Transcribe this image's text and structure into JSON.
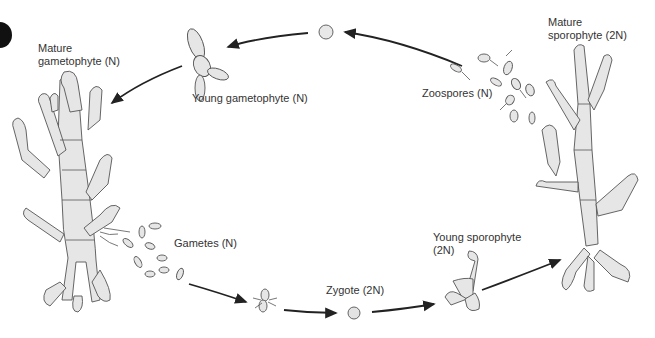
{
  "diagram": {
    "type": "life-cycle",
    "title": "",
    "stages": [
      {
        "id": "mature_gametophyte",
        "label": "Mature\ngametophyte (N)"
      },
      {
        "id": "young_gametophyte",
        "label": "Young gametophyte (N)"
      },
      {
        "id": "spore",
        "label": ""
      },
      {
        "id": "zoospores",
        "label": "Zoospores (N)"
      },
      {
        "id": "mature_sporophyte",
        "label": "Mature\nsporophyte (2N)"
      },
      {
        "id": "gametes",
        "label": "Gametes (N)"
      },
      {
        "id": "fusing_gametes",
        "label": ""
      },
      {
        "id": "zygote",
        "label": "Zygote (2N)"
      },
      {
        "id": "young_sporophyte",
        "label": "Young sporophyte\n(2N)"
      }
    ],
    "flow": [
      [
        "mature_gametophyte",
        "gametes"
      ],
      [
        "gametes",
        "fusing_gametes"
      ],
      [
        "fusing_gametes",
        "zygote"
      ],
      [
        "zygote",
        "young_sporophyte"
      ],
      [
        "young_sporophyte",
        "mature_sporophyte"
      ],
      [
        "mature_sporophyte",
        "zoospores"
      ],
      [
        "zoospores",
        "spore"
      ],
      [
        "spore",
        "young_gametophyte"
      ],
      [
        "young_gametophyte",
        "mature_gametophyte"
      ]
    ],
    "colors": {
      "line": "#222222",
      "cell_fill": "#e6e6e6",
      "text": "#333333"
    }
  }
}
